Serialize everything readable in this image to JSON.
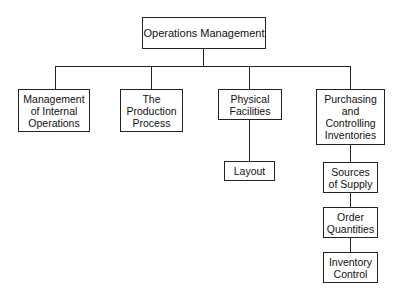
{
  "diagram": {
    "type": "org-chart",
    "root": {
      "label": "Operations Management"
    },
    "children": [
      {
        "label": "Management\nof Internal\nOperations"
      },
      {
        "label": "The\nProduction\nProcess"
      },
      {
        "label": "Physical\nFacilities",
        "children": [
          {
            "label": "Layout"
          }
        ]
      },
      {
        "label": "Purchasing\nand\nControlling\nInventories",
        "children": [
          {
            "label": "Sources\nof Supply"
          },
          {
            "label": "Order\nQuantities"
          },
          {
            "label": "Inventory\nControl"
          }
        ]
      }
    ]
  }
}
